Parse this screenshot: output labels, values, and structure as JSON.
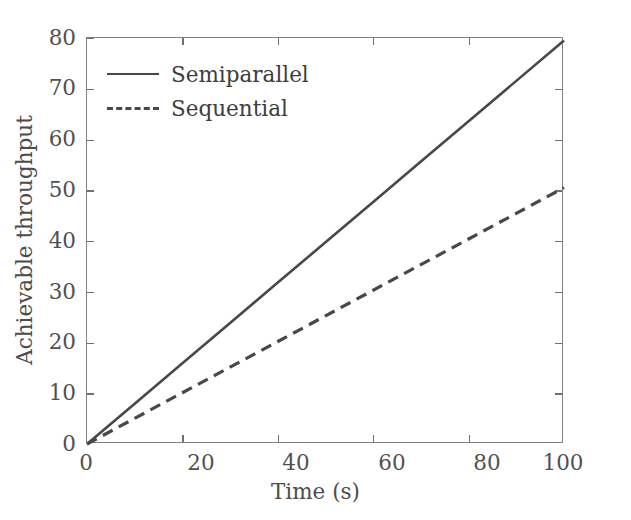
{
  "chart_data": {
    "type": "line",
    "title": "",
    "xlabel": "Time (s)",
    "ylabel": "Achievable throughput",
    "xlim": [
      0,
      100
    ],
    "ylim": [
      0,
      80
    ],
    "xticks": [
      0,
      20,
      40,
      60,
      80,
      100
    ],
    "yticks": [
      0,
      10,
      20,
      30,
      40,
      50,
      60,
      70,
      80
    ],
    "grid": false,
    "legend_position": "upper left",
    "x": [
      0,
      10,
      20,
      30,
      40,
      50,
      60,
      70,
      80,
      90,
      100
    ],
    "series": [
      {
        "name": "Semiparallel",
        "style": "solid",
        "color": "#4a4746",
        "values": [
          0,
          7.95,
          15.9,
          23.85,
          31.8,
          39.75,
          47.7,
          55.65,
          63.6,
          71.55,
          79.5
        ]
      },
      {
        "name": "Sequential",
        "style": "dashed",
        "color": "#4a4746",
        "values": [
          0,
          5.05,
          10.1,
          15.15,
          20.2,
          25.25,
          30.3,
          35.35,
          40.4,
          45.45,
          50.5
        ]
      }
    ],
    "annotations": []
  },
  "axes": {
    "x_tick_labels": [
      "0",
      "20",
      "40",
      "60",
      "80",
      "100"
    ],
    "y_tick_labels": [
      "0",
      "10",
      "20",
      "30",
      "40",
      "50",
      "60",
      "70",
      "80"
    ],
    "x_title": "Time (s)",
    "y_title": "Achievable throughput"
  },
  "legend": {
    "entries": [
      {
        "label": "Semiparallel",
        "style": "solid"
      },
      {
        "label": "Sequential",
        "style": "dashed"
      }
    ]
  },
  "colors": {
    "line": "#4a4746",
    "frame": "#808080",
    "text": "#4e4b4a",
    "background": "#ffffff"
  }
}
